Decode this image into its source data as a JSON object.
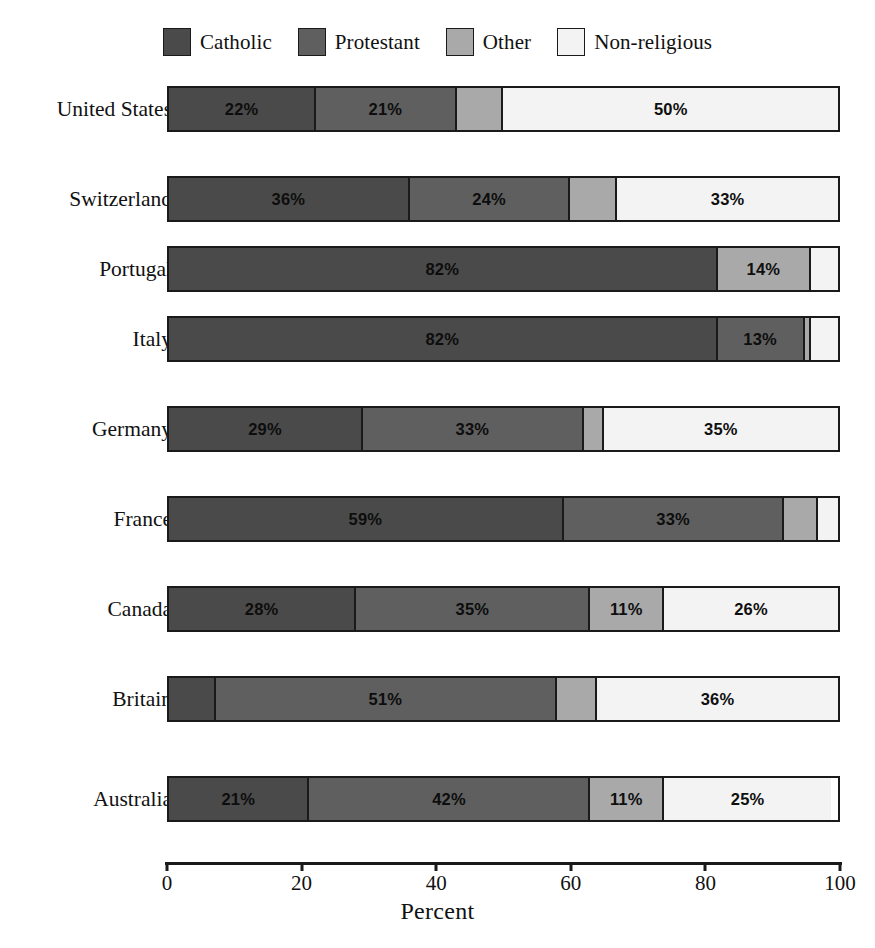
{
  "chart_data": {
    "type": "bar",
    "subtype": "stacked-horizontal-100pct",
    "title": "",
    "xlabel": "Percent",
    "ylabel": "",
    "xlim": [
      0,
      100
    ],
    "xticks": [
      0,
      20,
      40,
      60,
      80,
      100
    ],
    "xticklabels": [
      "0",
      "20",
      "40",
      "60",
      "80",
      "100"
    ],
    "grid": false,
    "legend_position": "top-center",
    "legend": [
      "Catholic",
      "Protestant",
      "Other",
      "Non-religious"
    ],
    "colors": {
      "Catholic": "#4a4a4a",
      "Protestant": "#5f5f5f",
      "Other": "#a9a9a9",
      "Non-religious": "#f3f3f3",
      "outline": "#1a1a1a"
    },
    "categories": [
      "United States",
      "Switzerland",
      "Portugal",
      "Italy",
      "Germany",
      "France",
      "Canada",
      "Britain",
      "Australia"
    ],
    "series": [
      {
        "name": "Catholic",
        "values": [
          22,
          36,
          82,
          82,
          29,
          59,
          28,
          7,
          21
        ]
      },
      {
        "name": "Protestant",
        "values": [
          21,
          24,
          0,
          13,
          33,
          33,
          35,
          51,
          42
        ]
      },
      {
        "name": "Other",
        "values": [
          7,
          7,
          14,
          1,
          3,
          5,
          11,
          6,
          11
        ]
      },
      {
        "name": "Non-religious",
        "values": [
          50,
          33,
          4,
          4,
          35,
          3,
          26,
          36,
          25
        ]
      }
    ],
    "bar_labels": [
      [
        "22%",
        "21%",
        "",
        "50%"
      ],
      [
        "36%",
        "24%",
        "",
        "33%"
      ],
      [
        "82%",
        "",
        "14%",
        ""
      ],
      [
        "82%",
        "13%",
        "",
        ""
      ],
      [
        "29%",
        "33%",
        "",
        "35%"
      ],
      [
        "59%",
        "33%",
        "",
        ""
      ],
      [
        "28%",
        "35%",
        "11%",
        "26%"
      ],
      [
        "",
        "51%",
        "",
        "36%"
      ],
      [
        "21%",
        "42%",
        "11%",
        "25%"
      ]
    ]
  },
  "legend": {
    "items": [
      {
        "label": "Catholic",
        "color": "#4a4a4a"
      },
      {
        "label": "Protestant",
        "color": "#5f5f5f"
      },
      {
        "label": "Other",
        "color": "#a9a9a9"
      },
      {
        "label": "Non-religious",
        "color": "#f3f3f3"
      }
    ]
  },
  "axis": {
    "title": "Percent",
    "ticks": [
      "0",
      "20",
      "40",
      "60",
      "80",
      "100"
    ]
  },
  "rows": [
    {
      "label": "United States"
    },
    {
      "label": "Switzerland"
    },
    {
      "label": "Portugal"
    },
    {
      "label": "Italy"
    },
    {
      "label": "Germany"
    },
    {
      "label": "France"
    },
    {
      "label": "Canada"
    },
    {
      "label": "Britain"
    },
    {
      "label": "Australia"
    }
  ]
}
